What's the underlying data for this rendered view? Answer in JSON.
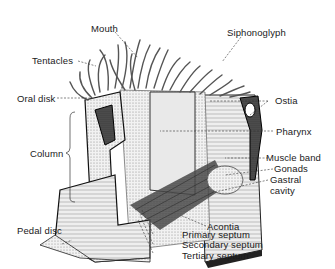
{
  "diagram": {
    "labels": {
      "mouth": "Mouth",
      "siphonoglyph": "Siphonoglyph",
      "tentacles": "Tentacles",
      "ostia": "Ostia",
      "oral_disk": "Oral disk",
      "pharynx": "Pharynx",
      "column": "Column",
      "muscle_band": "Muscle band",
      "gonads": "Gonads",
      "gastral_cavity_1": "Gastral",
      "gastral_cavity_2": "cavity",
      "pedal_disc": "Pedal disc",
      "acontia": "Acontia",
      "primary_septum": "Primary septum",
      "secondary_septum": "Secondary septum",
      "tertiary_septum": "Tertiary septum"
    },
    "colors": {
      "ink": "#1a1a1a",
      "shade": "#8a8a8a",
      "light": "#d6d6d6",
      "background": "#ffffff"
    }
  }
}
